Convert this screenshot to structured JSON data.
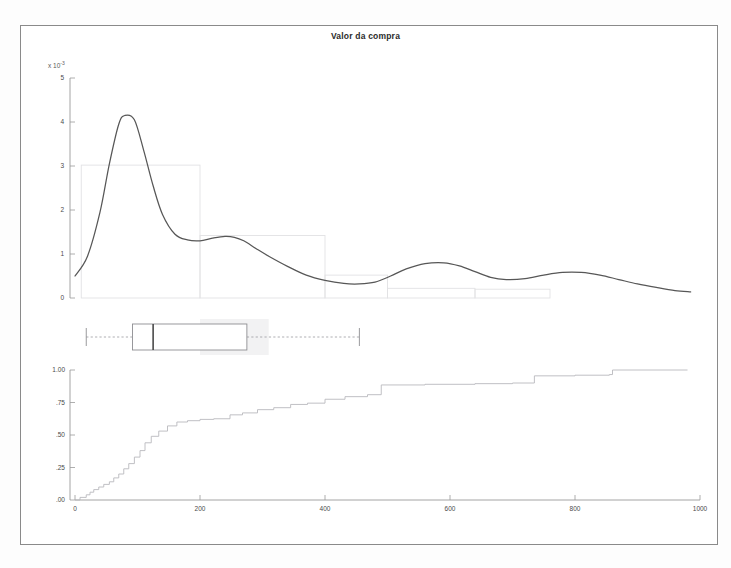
{
  "figure": {
    "title": "Valor da compra",
    "background_color": "#ffffff",
    "frame_color": "#8a8a8a",
    "exponent_label": "x 10",
    "exponent_power": "-3"
  },
  "chart_data": {
    "type": "line",
    "title": "Valor da compra",
    "xlabel": "",
    "ylabel": "",
    "xlim": [
      0,
      1000
    ],
    "grid": false,
    "legend_position": "none",
    "panels": [
      {
        "name": "density-histogram",
        "type": "line",
        "ylabel_exponent": "x 10^-3",
        "ylim": [
          0,
          5
        ],
        "yticks": [
          "0",
          "1",
          "2",
          "3",
          "4",
          "5"
        ],
        "ytick_values": [
          0,
          1,
          2,
          3,
          4,
          5
        ],
        "series": [
          {
            "name": "kernel density estimate",
            "color": "#575757",
            "x": [
              0,
              20,
              40,
              55,
              70,
              80,
              95,
              110,
              125,
              140,
              160,
              180,
              200,
              220,
              240,
              255,
              270,
              290,
              310,
              340,
              370,
              400,
              430,
              455,
              480,
              505,
              530,
              560,
              590,
              615,
              640,
              665,
              690,
              720,
              750,
              780,
              810,
              840,
              870,
              900,
              930,
              960,
              985
            ],
            "y": [
              0.5,
              0.95,
              1.95,
              3.05,
              3.95,
              4.15,
              4.05,
              3.35,
              2.55,
              1.9,
              1.45,
              1.32,
              1.3,
              1.36,
              1.4,
              1.38,
              1.3,
              1.12,
              0.95,
              0.72,
              0.52,
              0.4,
              0.33,
              0.32,
              0.36,
              0.5,
              0.66,
              0.78,
              0.8,
              0.73,
              0.6,
              0.47,
              0.42,
              0.44,
              0.52,
              0.58,
              0.58,
              0.52,
              0.42,
              0.32,
              0.24,
              0.17,
              0.14
            ]
          }
        ],
        "histogram": {
          "name": "histogram bins",
          "color": "#e2e2e4",
          "bin_edges": [
            10,
            200,
            400,
            500
          ],
          "bin_heights": [
            3.02,
            1.42,
            0.52
          ],
          "extra_bins": [
            {
              "x0": 500,
              "x1": 640,
              "height": 0.22
            },
            {
              "x0": 640,
              "x1": 760,
              "height": 0.2
            }
          ]
        }
      },
      {
        "name": "boxplot",
        "type": "box",
        "whisker_low": 18,
        "q1": 92,
        "median": 125,
        "q3": 275,
        "whisker_high": 455,
        "shadow_x0": 200,
        "shadow_x1": 310
      },
      {
        "name": "empirical-cdf",
        "type": "line",
        "ylim": [
          0,
          1
        ],
        "yticks": [
          "1.00",
          ".75",
          ".50",
          ".25",
          ".00"
        ],
        "ytick_values": [
          1.0,
          0.75,
          0.5,
          0.25,
          0.0
        ],
        "xticks": [
          "0",
          "200",
          "400",
          "600",
          "800",
          "1000"
        ],
        "xtick_values": [
          0,
          200,
          400,
          600,
          800,
          1000
        ],
        "series": [
          {
            "name": "cumulative distribution",
            "color": "#b9b9bd",
            "x": [
              8,
              18,
              24,
              30,
              38,
              46,
              55,
              62,
              70,
              78,
              86,
              95,
              104,
              112,
              122,
              134,
              148,
              163,
              180,
              200,
              222,
              248,
              268,
              292,
              318,
              345,
              372,
              400,
              432,
              468,
              490,
              560,
              640,
              700,
              735,
              800,
              855,
              860
            ],
            "y": [
              0.02,
              0.04,
              0.06,
              0.08,
              0.1,
              0.12,
              0.14,
              0.17,
              0.2,
              0.24,
              0.28,
              0.33,
              0.38,
              0.44,
              0.49,
              0.53,
              0.57,
              0.6,
              0.61,
              0.62,
              0.625,
              0.655,
              0.67,
              0.695,
              0.71,
              0.735,
              0.745,
              0.775,
              0.795,
              0.81,
              0.885,
              0.89,
              0.895,
              0.9,
              0.955,
              0.96,
              0.965,
              1.0
            ]
          }
        ]
      }
    ]
  }
}
